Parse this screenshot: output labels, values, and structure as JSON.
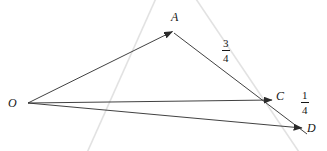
{
  "figure": {
    "type": "vector-geometry-diagram",
    "background_color": "#ffffff",
    "vector_color": "#2b2b2b",
    "guide_color": "#e2e2e2",
    "label_color": "#151515",
    "points": [
      {
        "id": "O",
        "label": "O",
        "x": 28,
        "y": 103,
        "label_x": 8,
        "label_y": 97
      },
      {
        "id": "A",
        "label": "A",
        "x": 172,
        "y": 31,
        "label_x": 171,
        "label_y": 11
      },
      {
        "id": "C",
        "label": "C",
        "x": 272,
        "y": 100,
        "label_x": 276,
        "label_y": 90
      },
      {
        "id": "D",
        "label": "D",
        "x": 302,
        "y": 128,
        "label_x": 307,
        "label_y": 122
      }
    ],
    "vectors": [
      {
        "id": "OA",
        "from": "O",
        "to": "A",
        "arrow": true
      },
      {
        "id": "OC",
        "from": "O",
        "to": "C",
        "arrow": true
      },
      {
        "id": "OD",
        "from": "O",
        "to": "D",
        "arrow": true
      },
      {
        "id": "AD",
        "from": "A",
        "to": "D",
        "arrow": false
      }
    ],
    "segment_labels": [
      {
        "id": "AC-ratio",
        "numerator": "3",
        "denominator": "4",
        "x": 222,
        "y": 38
      },
      {
        "id": "CD-ratio",
        "numerator": "1",
        "denominator": "4",
        "x": 301,
        "y": 90
      }
    ],
    "guide_lines": [
      {
        "id": "guide-left",
        "x1": 157,
        "y1": -4,
        "x2": 86,
        "y2": 155
      },
      {
        "id": "guide-right",
        "x1": 194,
        "y1": -4,
        "x2": 301,
        "y2": 155
      }
    ]
  }
}
